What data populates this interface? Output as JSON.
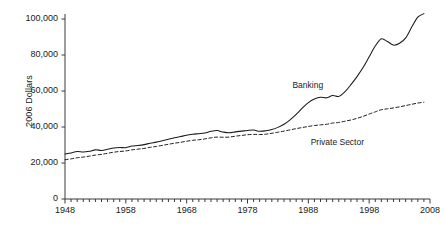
{
  "chart_data": {
    "type": "line",
    "title": "",
    "xlabel": "",
    "ylabel": "2006 Dollars",
    "xlim": [
      1948,
      2008
    ],
    "ylim": [
      0,
      100000
    ],
    "grid": false,
    "legend_position": "inline-annotation",
    "y_ticks": [
      0,
      20000,
      40000,
      60000,
      80000,
      100000
    ],
    "y_tick_labels": [
      "0",
      "20,000",
      "40,000",
      "60,000",
      "80,000",
      "100,000"
    ],
    "x_ticks": [
      1948,
      1958,
      1968,
      1978,
      1988,
      1998,
      2008
    ],
    "x_tick_labels": [
      "1948",
      "1958",
      "1968",
      "1978",
      "1988",
      "1998",
      "2008"
    ],
    "x_minor_tick_interval": 1,
    "x": [
      1948,
      1949,
      1950,
      1951,
      1952,
      1953,
      1954,
      1955,
      1956,
      1957,
      1958,
      1959,
      1960,
      1961,
      1962,
      1963,
      1964,
      1965,
      1966,
      1967,
      1968,
      1969,
      1970,
      1971,
      1972,
      1973,
      1974,
      1975,
      1976,
      1977,
      1978,
      1979,
      1980,
      1981,
      1982,
      1983,
      1984,
      1985,
      1986,
      1987,
      1988,
      1989,
      1990,
      1991,
      1992,
      1993,
      1994,
      1995,
      1996,
      1997,
      1998,
      1999,
      2000,
      2001,
      2002,
      2003,
      2004,
      2005,
      2006,
      2007
    ],
    "series": [
      {
        "name": "Banking",
        "style": "solid",
        "color": "#1a1a1a",
        "label_x": 1989,
        "label_y": 63000,
        "values": [
          25000,
          25600,
          26400,
          26100,
          26500,
          27300,
          27000,
          27600,
          28300,
          28600,
          28500,
          29400,
          29700,
          30200,
          31000,
          31600,
          32400,
          33200,
          34000,
          34700,
          35400,
          36000,
          36300,
          36700,
          37600,
          38000,
          37200,
          36800,
          37300,
          37700,
          38100,
          38300,
          37600,
          37900,
          38600,
          39800,
          41500,
          44000,
          47000,
          50500,
          53500,
          55500,
          56500,
          56200,
          57500,
          57000,
          59500,
          63500,
          68000,
          73000,
          79000,
          85000,
          89000,
          87500,
          85500,
          86500,
          89500,
          95500,
          101000,
          103000
        ]
      },
      {
        "name": "Private Sector",
        "style": "dashed",
        "color": "#1a1a1a",
        "label_x": 1992,
        "label_y": 31000,
        "values": [
          21800,
          22300,
          22900,
          23300,
          23800,
          24400,
          24800,
          25400,
          26000,
          26400,
          26700,
          27300,
          27700,
          28100,
          28700,
          29200,
          29800,
          30400,
          31000,
          31500,
          32100,
          32600,
          32900,
          33400,
          34000,
          34400,
          34300,
          34400,
          34900,
          35300,
          35700,
          35900,
          35800,
          36000,
          36500,
          37100,
          37700,
          38400,
          39100,
          39700,
          40300,
          40800,
          41200,
          41500,
          42200,
          42500,
          43200,
          43900,
          44800,
          45900,
          47200,
          48400,
          49600,
          50100,
          50600,
          51200,
          51900,
          52600,
          53300,
          53800
        ]
      }
    ]
  }
}
